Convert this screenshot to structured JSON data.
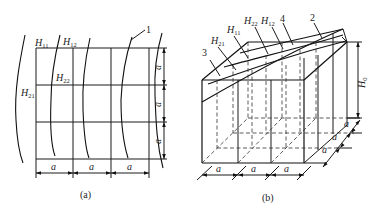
{
  "panel_a": {
    "caption": "(a)",
    "labels": {
      "H11": {
        "base": "H",
        "sub": "11"
      },
      "H12": {
        "base": "H",
        "sub": "12"
      },
      "H22": {
        "base": "H",
        "sub": "22"
      },
      "H21": {
        "base": "H",
        "sub": "21"
      }
    },
    "callout_1": "1",
    "dim_a": "a"
  },
  "panel_b": {
    "caption": "(b)",
    "labels": {
      "H11": {
        "base": "H",
        "sub": "11"
      },
      "H21": {
        "base": "H",
        "sub": "21"
      },
      "H22": {
        "base": "H",
        "sub": "22"
      },
      "H12": {
        "base": "H",
        "sub": "12"
      },
      "H0": {
        "base": "H",
        "sub": "0"
      }
    },
    "callout_2": "2",
    "callout_3": "3",
    "callout_4": "4",
    "dim_a": "a"
  }
}
